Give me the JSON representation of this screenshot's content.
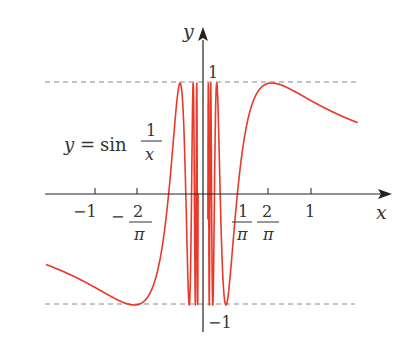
{
  "chart_data": {
    "type": "line",
    "title": "",
    "function_label": {
      "lhs": "y",
      "eq": "=",
      "fn": "sin",
      "num": "1",
      "den": "x"
    },
    "xlabel": "x",
    "ylabel": "y",
    "xlim": [
      -1.45,
      1.65
    ],
    "ylim": [
      -1.05,
      1.05
    ],
    "x_ticks": [
      {
        "value": -1,
        "label": "−1"
      },
      {
        "value": -0.6366,
        "label_num": "2",
        "label_den": "π",
        "sign": "−"
      },
      {
        "value": 0.3183,
        "label_num": "1",
        "label_den": "π",
        "tick": false
      },
      {
        "value": 0.6366,
        "label_num": "2",
        "label_den": "π"
      },
      {
        "value": 1,
        "label": "1"
      }
    ],
    "y_ticks": [
      {
        "value": 1,
        "label": "1"
      },
      {
        "value": -1,
        "label": "−1"
      }
    ],
    "reference_lines": [
      {
        "y": 1,
        "style": "dashed"
      },
      {
        "y": -1,
        "style": "dashed"
      }
    ],
    "series": [
      {
        "name": "y = sin(1/x)",
        "color": "#e8392a"
      }
    ],
    "grid": false,
    "legend": "none"
  },
  "labels": {
    "y_axis": "y",
    "x_axis": "x",
    "y_one": "1",
    "y_neg_one": "−1",
    "x_neg_one": "−1",
    "x_one": "1",
    "neg_sign": "−",
    "two": "2",
    "one": "1",
    "pi": "π",
    "fn_lhs": "y",
    "fn_eq": "=",
    "fn_sin": "sin",
    "fn_num": "1",
    "fn_den": "x"
  },
  "colors": {
    "curve": "#e8392a",
    "axis": "#222222",
    "dash": "#888888",
    "text": "#333333"
  }
}
